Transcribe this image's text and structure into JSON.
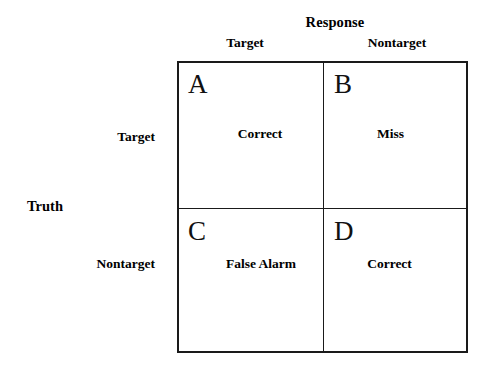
{
  "diagram": {
    "type": "confusion-matrix",
    "columns": {
      "axis_title": "Response",
      "headers": [
        "Target",
        "Nontarget"
      ]
    },
    "rows": {
      "axis_title": "Truth",
      "headers": [
        "Target",
        "Nontarget"
      ]
    },
    "cells": [
      {
        "letter": "A",
        "label": "Correct",
        "row": "Target",
        "column": "Target"
      },
      {
        "letter": "B",
        "label": "Miss",
        "row": "Target",
        "column": "Nontarget"
      },
      {
        "letter": "C",
        "label": "False Alarm",
        "row": "Nontarget",
        "column": "Target"
      },
      {
        "letter": "D",
        "label": "Correct",
        "row": "Nontarget",
        "column": "Nontarget"
      }
    ],
    "colors": {
      "background": "#ffffff",
      "border": "#1a1a1a",
      "text": "#000000"
    }
  }
}
